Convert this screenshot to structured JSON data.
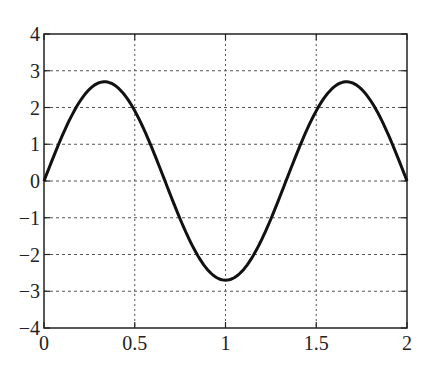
{
  "chart_data": {
    "type": "line",
    "title": "",
    "xlabel": "",
    "ylabel": "",
    "xlim": [
      0,
      2
    ],
    "ylim": [
      -4,
      4
    ],
    "grid": true,
    "grid_style": "dotted",
    "legend": null,
    "x_ticks": [
      0,
      0.5,
      1,
      1.5,
      2
    ],
    "x_tick_labels": [
      "0",
      "0.5",
      "1",
      "1.5",
      "2"
    ],
    "y_ticks": [
      4,
      3,
      2,
      1,
      0,
      -1,
      -2,
      -3,
      -4
    ],
    "y_tick_labels": [
      "4",
      "3",
      "2",
      "1",
      "0",
      "−1",
      "−2",
      "−3",
      "−4"
    ],
    "series": [
      {
        "name": "curve",
        "color": "#111111",
        "function": "2.7*sin(1.5*pi*x)",
        "x": [
          0,
          0.1,
          0.2,
          0.3333,
          0.5,
          0.6667,
          0.8,
          0.9,
          1.0,
          1.1,
          1.2,
          1.3333,
          1.5,
          1.6667,
          1.8,
          1.9,
          2.0
        ],
        "y": [
          0,
          1.23,
          2.18,
          2.7,
          1.91,
          0,
          -1.59,
          -2.41,
          -2.7,
          -2.41,
          -1.59,
          0,
          1.91,
          2.7,
          2.18,
          1.23,
          0
        ]
      }
    ]
  }
}
